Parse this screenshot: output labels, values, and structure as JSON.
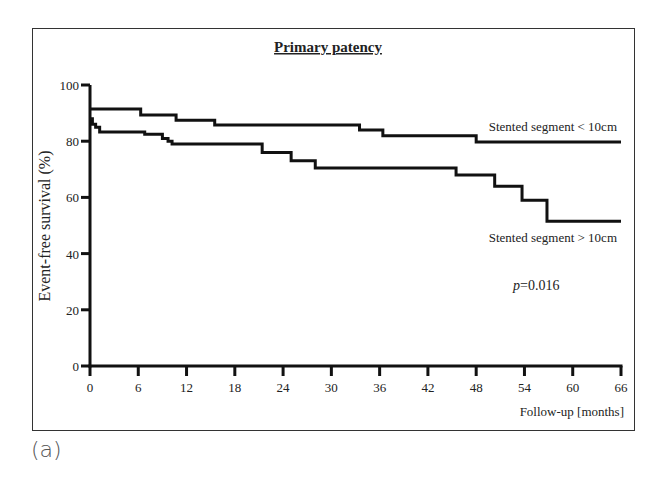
{
  "panel_label": "(a)",
  "chart_data": {
    "type": "line",
    "subtype": "kaplan-meier step",
    "title": "Primary patency",
    "xlabel": "Follow-up [months]",
    "ylabel": "Event-free survival (%)",
    "xlim": [
      0,
      66
    ],
    "ylim": [
      0,
      100
    ],
    "x_ticks": [
      0,
      6,
      12,
      18,
      24,
      30,
      36,
      42,
      48,
      54,
      60,
      66
    ],
    "y_ticks": [
      0,
      20,
      40,
      60,
      80,
      100
    ],
    "grid": false,
    "legend": "inline labels at right end of curves",
    "annotation": {
      "p_label": "p",
      "p_value": "=0.016"
    },
    "series": [
      {
        "name": "Stented segment < 10cm",
        "steps": [
          [
            0,
            91.5
          ],
          [
            6.3,
            89.3
          ],
          [
            10.7,
            87.5
          ],
          [
            15.5,
            85.8
          ],
          [
            33.5,
            84.0
          ],
          [
            36.4,
            81.9
          ],
          [
            48.0,
            79.7
          ],
          [
            66.0,
            79.7
          ]
        ]
      },
      {
        "name": "Stented segment > 10cm",
        "steps": [
          [
            0,
            88.0
          ],
          [
            0.3,
            86.0
          ],
          [
            0.7,
            85.0
          ],
          [
            1.2,
            83.3
          ],
          [
            6.8,
            82.5
          ],
          [
            9.0,
            81.0
          ],
          [
            9.7,
            80.0
          ],
          [
            10.2,
            79.0
          ],
          [
            21.4,
            76.0
          ],
          [
            25.0,
            73.0
          ],
          [
            28.0,
            70.5
          ],
          [
            45.5,
            68.0
          ],
          [
            50.3,
            64.0
          ],
          [
            53.7,
            59.0
          ],
          [
            56.8,
            51.5
          ],
          [
            66.0,
            51.5
          ]
        ]
      }
    ]
  }
}
